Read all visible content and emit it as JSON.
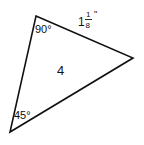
{
  "diagram": {
    "shape": "triangle",
    "vertices": {
      "top": [
        36,
        16
      ],
      "right": [
        133,
        58
      ],
      "bottom_left": [
        10,
        132
      ]
    },
    "angles": {
      "top": "90°",
      "bottom_left": "45°"
    },
    "side_label": {
      "whole": "1",
      "numerator": "1",
      "denominator": "8",
      "unit": "\""
    },
    "center_label": "4",
    "stroke_color": "#111111"
  }
}
